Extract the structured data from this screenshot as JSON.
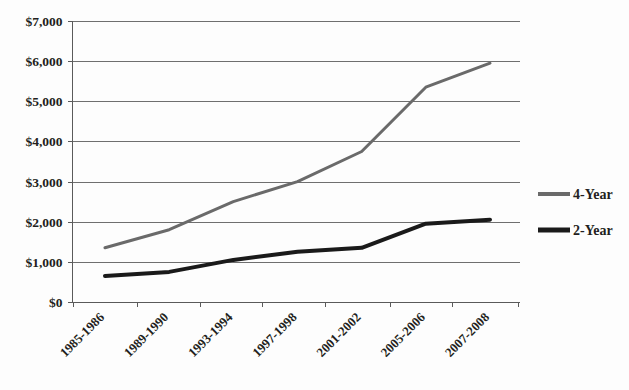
{
  "chart_data": {
    "type": "line",
    "title": "",
    "subtitle": "",
    "xlabel": "",
    "ylabel": "",
    "categories": [
      "1985-1986",
      "1989-1990",
      "1993-1994",
      "1997-1998",
      "2001-2002",
      "2005-2006",
      "2007-2008"
    ],
    "series": [
      {
        "name": "4-Year",
        "color": "#6a6a6a",
        "line_width": 3,
        "values": [
          1350,
          1800,
          2500,
          3000,
          3750,
          5350,
          5950
        ]
      },
      {
        "name": "2-Year",
        "color": "#1a1a1a",
        "line_width": 4,
        "values": [
          650,
          750,
          1050,
          1250,
          1350,
          1950,
          2050
        ]
      }
    ],
    "ylim": [
      0,
      7000
    ],
    "ytick_values": [
      0,
      1000,
      2000,
      3000,
      4000,
      5000,
      6000,
      7000
    ],
    "ytick_labels": [
      "$0",
      "$1,000",
      "$2,000",
      "$3,000",
      "$4,000",
      "$5,000",
      "$6,000",
      "$7,000"
    ],
    "grid": "horizontal",
    "legend_position": "right",
    "legend_entries": [
      "4-Year",
      "2-Year"
    ],
    "xtick_label_rotation": -45
  },
  "axes": {
    "y_axis_name": "y-axis",
    "x_axis_name": "x-axis"
  },
  "colors": {
    "grid": "#6f6f6f",
    "axis": "#5a5a5a",
    "text": "#231f20",
    "background": "#fdfdfd",
    "series_4year": "#6a6a6a",
    "series_2year": "#1a1a1a"
  }
}
